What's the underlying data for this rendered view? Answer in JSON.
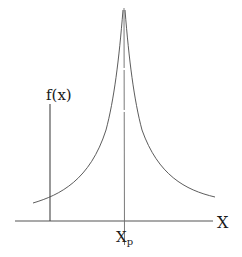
{
  "diagram": {
    "type": "peaked-function-sketch",
    "y_axis_label": "f(x)",
    "x_axis_label": "X",
    "peak_label_main": "X",
    "peak_label_sub": "p",
    "colors": {
      "background": "#ffffff",
      "stroke": "#4a4a4a",
      "axis": "#555555",
      "text": "#1a1a1a"
    },
    "geometry": {
      "x_axis": {
        "x1": 15,
        "x2": 213,
        "y": 221
      },
      "f_axis": {
        "x": 50,
        "y1": 104,
        "y2": 221
      },
      "peak_line": {
        "x": 124,
        "y1": 8,
        "y2": 245
      },
      "curve_left_start": [
        33,
        203
      ],
      "curve_peak": [
        124,
        10
      ],
      "curve_right_end": [
        215,
        197
      ]
    }
  }
}
